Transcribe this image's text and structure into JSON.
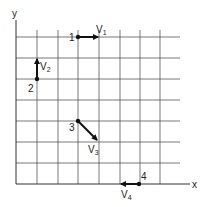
{
  "diagram": {
    "axes": {
      "x_label": "x",
      "y_label": "y"
    },
    "grid": {
      "columns": 8,
      "rows": 7
    },
    "points": [
      {
        "id": "1",
        "label": "1",
        "vector": "V",
        "vector_sub": "1",
        "direction": "right"
      },
      {
        "id": "2",
        "label": "2",
        "vector": "V",
        "vector_sub": "2",
        "direction": "up"
      },
      {
        "id": "3",
        "label": "3",
        "vector": "V",
        "vector_sub": "3",
        "direction": "down-right"
      },
      {
        "id": "4",
        "label": "4",
        "vector": "V",
        "vector_sub": "4",
        "direction": "left"
      }
    ]
  }
}
